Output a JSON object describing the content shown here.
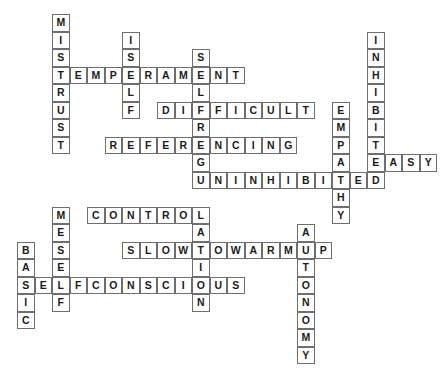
{
  "puzzle": {
    "title": "Temperament Crossword Grid",
    "type": "crossword-word-grid",
    "grid": {
      "cols": 23,
      "rows": 20,
      "cell_size_px": 17.5,
      "origin_x_px": 17,
      "origin_y_px": 14,
      "cell_border_color": "#6e6e6e",
      "cell_fill_color": "#ffffff",
      "letter_color": "#1a1a1a",
      "background_color": "#ffffff"
    },
    "entries": [
      {
        "word": "MISTRUST",
        "direction": "down",
        "col": 2,
        "row": 0
      },
      {
        "word": "ISELF",
        "direction": "down",
        "col": 6,
        "row": 2
      },
      {
        "word": "SELFREGULATION",
        "direction": "down",
        "col": 10,
        "row": 3
      },
      {
        "word": "TEMPERAMENT",
        "direction": "across",
        "col": 2,
        "row": 3
      },
      {
        "word": "INHIBITED",
        "direction": "down",
        "col": 20,
        "row": 2
      },
      {
        "word": "DIFFICULT",
        "direction": "across",
        "col": 8,
        "row": 5
      },
      {
        "word": "EMPATHY",
        "direction": "down",
        "col": 18,
        "row": 5
      },
      {
        "word": "REFERENCING",
        "direction": "across",
        "col": 5,
        "row": 7
      },
      {
        "word": "EASY",
        "direction": "across",
        "col": 20,
        "row": 9
      },
      {
        "word": "UNINHIBITED",
        "direction": "across",
        "col": 10,
        "row": 10
      },
      {
        "word": "CONTROL",
        "direction": "across",
        "col": 4,
        "row": 11
      },
      {
        "word": "MESELF",
        "direction": "down",
        "col": 2,
        "row": 11
      },
      {
        "word": "AUTONOMY",
        "direction": "down",
        "col": 16,
        "row": 12
      },
      {
        "word": "SLOWTOWARMUP",
        "direction": "across",
        "col": 6,
        "row": 13
      },
      {
        "word": "BASIC",
        "direction": "down",
        "col": 0,
        "row": 13
      },
      {
        "word": "SELFCONSCIOUS",
        "direction": "across",
        "col": 0,
        "row": 15
      }
    ],
    "cells": [
      {
        "l": "M",
        "c": 2,
        "r": 0
      },
      {
        "l": "I",
        "c": 2,
        "r": 1
      },
      {
        "l": "I",
        "c": 6,
        "r": 1
      },
      {
        "l": "S",
        "c": 2,
        "r": 2
      },
      {
        "l": "S",
        "c": 6,
        "r": 2
      },
      {
        "l": "S",
        "c": 10,
        "r": 2
      },
      {
        "l": "I",
        "c": 20,
        "r": 1
      },
      {
        "l": "N",
        "c": 20,
        "r": 2
      },
      {
        "l": "T",
        "c": 2,
        "r": 3
      },
      {
        "l": "E",
        "c": 3,
        "r": 3
      },
      {
        "l": "M",
        "c": 4,
        "r": 3
      },
      {
        "l": "P",
        "c": 5,
        "r": 3
      },
      {
        "l": "E",
        "c": 6,
        "r": 3
      },
      {
        "l": "R",
        "c": 7,
        "r": 3
      },
      {
        "l": "A",
        "c": 8,
        "r": 3
      },
      {
        "l": "M",
        "c": 9,
        "r": 3
      },
      {
        "l": "E",
        "c": 10,
        "r": 3
      },
      {
        "l": "N",
        "c": 11,
        "r": 3
      },
      {
        "l": "T",
        "c": 12,
        "r": 3
      },
      {
        "l": "H",
        "c": 20,
        "r": 3
      },
      {
        "l": "R",
        "c": 2,
        "r": 4
      },
      {
        "l": "L",
        "c": 6,
        "r": 4
      },
      {
        "l": "L",
        "c": 10,
        "r": 4
      },
      {
        "l": "I",
        "c": 20,
        "r": 4
      },
      {
        "l": "U",
        "c": 2,
        "r": 5
      },
      {
        "l": "F",
        "c": 6,
        "r": 5
      },
      {
        "l": "D",
        "c": 8,
        "r": 5
      },
      {
        "l": "I",
        "c": 9,
        "r": 5
      },
      {
        "l": "F",
        "c": 10,
        "r": 5
      },
      {
        "l": "F",
        "c": 11,
        "r": 5
      },
      {
        "l": "I",
        "c": 12,
        "r": 5
      },
      {
        "l": "C",
        "c": 13,
        "r": 5
      },
      {
        "l": "U",
        "c": 14,
        "r": 5
      },
      {
        "l": "L",
        "c": 15,
        "r": 5
      },
      {
        "l": "T",
        "c": 16,
        "r": 5
      },
      {
        "l": "E",
        "c": 18,
        "r": 5
      },
      {
        "l": "B",
        "c": 20,
        "r": 5
      },
      {
        "l": "S",
        "c": 2,
        "r": 6
      },
      {
        "l": "R",
        "c": 10,
        "r": 6
      },
      {
        "l": "M",
        "c": 18,
        "r": 6
      },
      {
        "l": "I",
        "c": 20,
        "r": 6
      },
      {
        "l": "T",
        "c": 2,
        "r": 7
      },
      {
        "l": "R",
        "c": 5,
        "r": 7
      },
      {
        "l": "E",
        "c": 6,
        "r": 7
      },
      {
        "l": "F",
        "c": 7,
        "r": 7
      },
      {
        "l": "E",
        "c": 8,
        "r": 7
      },
      {
        "l": "R",
        "c": 9,
        "r": 7
      },
      {
        "l": "E",
        "c": 10,
        "r": 7
      },
      {
        "l": "N",
        "c": 11,
        "r": 7
      },
      {
        "l": "C",
        "c": 12,
        "r": 7
      },
      {
        "l": "I",
        "c": 13,
        "r": 7
      },
      {
        "l": "N",
        "c": 14,
        "r": 7
      },
      {
        "l": "G",
        "c": 15,
        "r": 7
      },
      {
        "l": "P",
        "c": 18,
        "r": 7
      },
      {
        "l": "T",
        "c": 20,
        "r": 7
      },
      {
        "l": "G",
        "c": 10,
        "r": 8
      },
      {
        "l": "A",
        "c": 18,
        "r": 8
      },
      {
        "l": "E",
        "c": 20,
        "r": 8
      },
      {
        "l": "A",
        "c": 21,
        "r": 8
      },
      {
        "l": "S",
        "c": 22,
        "r": 8
      },
      {
        "l": "Y",
        "c": 23,
        "r": 8
      },
      {
        "l": "U",
        "c": 10,
        "r": 9
      },
      {
        "l": "N",
        "c": 11,
        "r": 9
      },
      {
        "l": "I",
        "c": 12,
        "r": 9
      },
      {
        "l": "N",
        "c": 13,
        "r": 9
      },
      {
        "l": "H",
        "c": 14,
        "r": 9
      },
      {
        "l": "I",
        "c": 15,
        "r": 9
      },
      {
        "l": "B",
        "c": 16,
        "r": 9
      },
      {
        "l": "I",
        "c": 17,
        "r": 9
      },
      {
        "l": "T",
        "c": 18,
        "r": 9
      },
      {
        "l": "E",
        "c": 19,
        "r": 9
      },
      {
        "l": "D",
        "c": 20,
        "r": 9
      },
      {
        "l": "H",
        "c": 18,
        "r": 10
      },
      {
        "l": "M",
        "c": 2,
        "r": 11
      },
      {
        "l": "C",
        "c": 4,
        "r": 11
      },
      {
        "l": "O",
        "c": 5,
        "r": 11
      },
      {
        "l": "N",
        "c": 6,
        "r": 11
      },
      {
        "l": "T",
        "c": 7,
        "r": 11
      },
      {
        "l": "R",
        "c": 8,
        "r": 11
      },
      {
        "l": "O",
        "c": 9,
        "r": 11
      },
      {
        "l": "L",
        "c": 10,
        "r": 11
      },
      {
        "l": "Y",
        "c": 18,
        "r": 11
      },
      {
        "l": "E",
        "c": 2,
        "r": 12
      },
      {
        "l": "A",
        "c": 10,
        "r": 12
      },
      {
        "l": "A",
        "c": 16,
        "r": 12
      },
      {
        "l": "B",
        "c": 0,
        "r": 13
      },
      {
        "l": "S",
        "c": 2,
        "r": 13
      },
      {
        "l": "S",
        "c": 6,
        "r": 13
      },
      {
        "l": "L",
        "c": 7,
        "r": 13
      },
      {
        "l": "O",
        "c": 8,
        "r": 13
      },
      {
        "l": "W",
        "c": 9,
        "r": 13
      },
      {
        "l": "T",
        "c": 10,
        "r": 13
      },
      {
        "l": "O",
        "c": 11,
        "r": 13
      },
      {
        "l": "W",
        "c": 12,
        "r": 13
      },
      {
        "l": "A",
        "c": 13,
        "r": 13
      },
      {
        "l": "R",
        "c": 14,
        "r": 13
      },
      {
        "l": "M",
        "c": 15,
        "r": 13
      },
      {
        "l": "U",
        "c": 16,
        "r": 13
      },
      {
        "l": "P",
        "c": 17,
        "r": 13
      },
      {
        "l": "A",
        "c": 0,
        "r": 14
      },
      {
        "l": "E",
        "c": 2,
        "r": 14
      },
      {
        "l": "I",
        "c": 10,
        "r": 14
      },
      {
        "l": "T",
        "c": 16,
        "r": 14
      },
      {
        "l": "S",
        "c": 0,
        "r": 15
      },
      {
        "l": "E",
        "c": 1,
        "r": 15
      },
      {
        "l": "L",
        "c": 2,
        "r": 15
      },
      {
        "l": "F",
        "c": 3,
        "r": 15
      },
      {
        "l": "C",
        "c": 4,
        "r": 15
      },
      {
        "l": "O",
        "c": 5,
        "r": 15
      },
      {
        "l": "N",
        "c": 6,
        "r": 15
      },
      {
        "l": "S",
        "c": 7,
        "r": 15
      },
      {
        "l": "C",
        "c": 8,
        "r": 15
      },
      {
        "l": "I",
        "c": 9,
        "r": 15
      },
      {
        "l": "O",
        "c": 10,
        "r": 15
      },
      {
        "l": "U",
        "c": 11,
        "r": 15
      },
      {
        "l": "S",
        "c": 12,
        "r": 15
      },
      {
        "l": "O",
        "c": 16,
        "r": 15
      },
      {
        "l": "I",
        "c": 0,
        "r": 16
      },
      {
        "l": "F",
        "c": 2,
        "r": 16
      },
      {
        "l": "N",
        "c": 10,
        "r": 16
      },
      {
        "l": "N",
        "c": 16,
        "r": 16
      },
      {
        "l": "C",
        "c": 0,
        "r": 17
      },
      {
        "l": "O",
        "c": 16,
        "r": 17
      },
      {
        "l": "M",
        "c": 16,
        "r": 18
      },
      {
        "l": "Y",
        "c": 16,
        "r": 19
      }
    ]
  }
}
